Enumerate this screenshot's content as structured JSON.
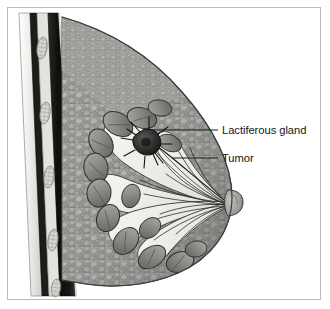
{
  "figure": {
    "style": "grayscale medical line and tone illustration",
    "width": 330,
    "height": 309
  },
  "frame": {
    "border_color": "#b9b9b9",
    "background_color": "#ffffff"
  },
  "labels": [
    {
      "id": "lactiferous-gland",
      "text": "Lactiferous gland",
      "text_x": 222,
      "text_y": 134,
      "leader_line": {
        "x1": 152,
        "y1": 130,
        "x2": 218,
        "y2": 130
      },
      "color": "#161616"
    },
    {
      "id": "tumor",
      "text": "Tumor",
      "text_x": 222,
      "text_y": 162,
      "leader_line": {
        "x1": 172,
        "y1": 158,
        "x2": 218,
        "y2": 158
      },
      "color": "#161616"
    }
  ],
  "anatomy": {
    "structures": [
      {
        "id": "skin-layer",
        "name": "Skin layer",
        "color": "#e8e8e6"
      },
      {
        "id": "pectoral-muscle",
        "name": "Pectoral muscle",
        "color": "#1a1a1a"
      },
      {
        "id": "rib",
        "name": "Rib cross-section",
        "color": "#d8d6d2",
        "count": 4
      },
      {
        "id": "fatty-tissue",
        "name": "Fatty tissue",
        "color": "#9c9c9a"
      },
      {
        "id": "lactiferous-gland-lobule",
        "name": "Lactiferous gland lobule",
        "color": "#8d8d8b",
        "count": 13
      },
      {
        "id": "lactiferous-duct",
        "name": "Lactiferous duct",
        "color": "#f2f1ee"
      },
      {
        "id": "nipple",
        "name": "Nipple",
        "color": "#a5a5a2"
      },
      {
        "id": "tumor-mass",
        "name": "Tumor mass",
        "color": "#2e2e2e"
      }
    ]
  },
  "colors": {
    "ink": "#161616",
    "leader_line": "#1b1b1b",
    "tissue_mid": "#9c9c9a",
    "tissue_light": "#cfcec9",
    "tissue_dark": "#5e5e5c",
    "muscle_dark": "#141414",
    "duct_white": "#f4f3f0"
  }
}
